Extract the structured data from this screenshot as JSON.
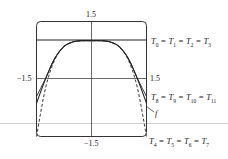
{
  "chart_data": {
    "type": "line",
    "title": "",
    "xlabel": "",
    "ylabel": "",
    "xlim": [
      -1.5,
      1.5
    ],
    "ylim": [
      -1.5,
      1.5
    ],
    "tick_labels": {
      "top": "1.5",
      "bottom": "−1.5",
      "left": "−1.5",
      "right": "1.5"
    },
    "grid": false,
    "series": [
      {
        "name": "f",
        "style": "solid",
        "x": [
          -1.5,
          -1.25,
          -1.0,
          -0.75,
          -0.5,
          -0.25,
          0,
          0.25,
          0.5,
          0.75,
          1.0,
          1.25,
          1.5
        ],
        "values": [
          -0.63,
          0.01,
          0.54,
          0.85,
          0.97,
          1.0,
          1.0,
          1.0,
          0.97,
          0.85,
          0.54,
          0.01,
          -0.63
        ]
      },
      {
        "name": "T0 = T1 = T2 = T3",
        "style": "solid",
        "x": [
          -1.5,
          1.5
        ],
        "values": [
          1,
          1
        ]
      },
      {
        "name": "T4 = T5 = T6 = T7",
        "style": "dashed",
        "x": [
          -1.5,
          -1.25,
          -1.0,
          -0.75,
          -0.5,
          -0.25,
          0,
          0.25,
          0.5,
          0.75,
          1.0,
          1.25,
          1.5
        ],
        "values": [
          -1.53,
          -0.22,
          0.5,
          0.84,
          0.97,
          1.0,
          1.0,
          1.0,
          0.97,
          0.84,
          0.5,
          -0.22,
          -1.53
        ]
      },
      {
        "name": "T8 = T9 = T10 = T11",
        "style": "solid",
        "x": [
          -1.5,
          -1.25,
          -1.0,
          -0.75,
          -0.5,
          -0.25,
          0,
          0.25,
          0.5,
          0.75,
          1.0,
          1.25,
          1.5
        ],
        "values": [
          -0.46,
          0.02,
          0.54,
          0.85,
          0.97,
          1.0,
          1.0,
          1.0,
          0.97,
          0.85,
          0.54,
          0.02,
          -0.46
        ]
      }
    ],
    "annotations": [
      {
        "text": "T0 = T1 = T2 = T3",
        "near_y": 1
      },
      {
        "text": "T8 = T9 = T10 = T11",
        "near_x": 1.5
      },
      {
        "text": "T4 = T5 = T6 = T7",
        "near_y": -1.5
      },
      {
        "text": "f",
        "arrow_to": "f curve at right"
      }
    ]
  },
  "labels": {
    "top_tick": "1.5",
    "bottom_tick": "−1.5",
    "left_tick": "−1.5",
    "right_tick": "1.5",
    "f": "f"
  },
  "equations": {
    "t0": {
      "parts": [
        "T",
        "0",
        " = T",
        "1",
        " = T",
        "2",
        " = T",
        "3"
      ]
    },
    "t8": {
      "parts": [
        "T",
        "8",
        " = T",
        "9",
        " = T",
        "10",
        " = T",
        "11"
      ]
    },
    "t4": {
      "parts": [
        "T",
        "4",
        " = T",
        "5",
        " = T",
        "6",
        " = T",
        "7"
      ]
    }
  }
}
